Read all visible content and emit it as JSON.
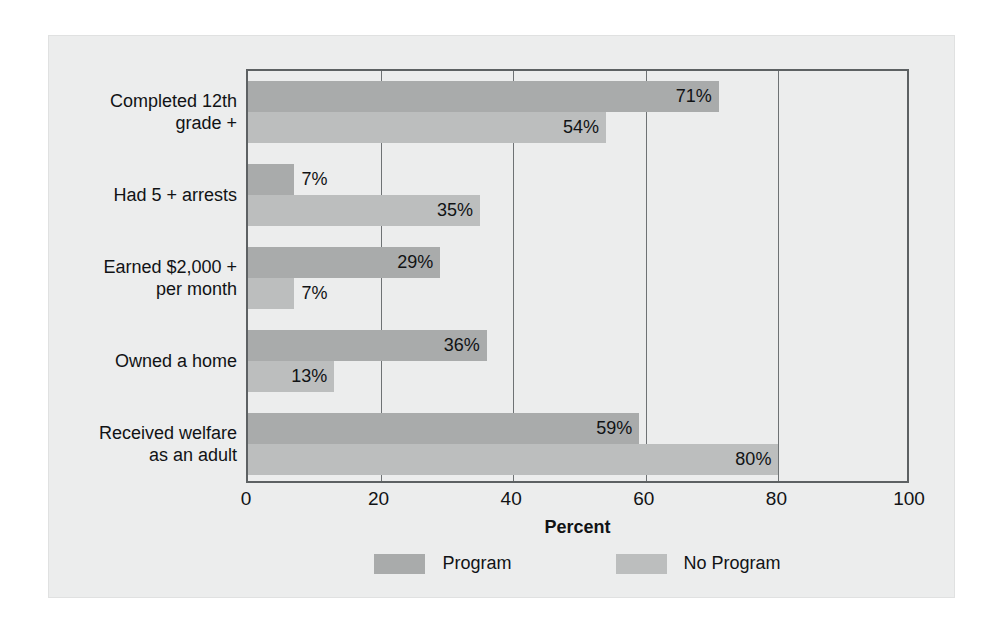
{
  "chart_data": {
    "type": "bar",
    "orientation": "horizontal",
    "title": "",
    "xlabel": "Percent",
    "ylabel": "",
    "xlim": [
      0,
      100
    ],
    "xticks": [
      "0",
      "20",
      "40",
      "60",
      "80",
      "100"
    ],
    "grid": true,
    "legend_position": "bottom",
    "categories": [
      "Completed 12th\ngrade +",
      "Had 5 + arrests",
      "Earned $2,000 +\nper month",
      "Owned a home",
      "Received welfare\nas an adult"
    ],
    "series": [
      {
        "name": "Program",
        "color": "#a9abab",
        "values": [
          71,
          7,
          29,
          36,
          59
        ],
        "labels": [
          "71%",
          "7%",
          "29%",
          "36%",
          "59%"
        ]
      },
      {
        "name": "No Program",
        "color": "#bcbebe",
        "values": [
          54,
          35,
          7,
          13,
          80
        ],
        "labels": [
          "54%",
          "35%",
          "7%",
          "13%",
          "80%"
        ]
      }
    ]
  },
  "colors": {
    "background": "#eceded",
    "axis": "#5d6163",
    "gridline": "#6e7274",
    "text": "#111315",
    "program": "#a9abab",
    "no_program": "#bcbebe"
  }
}
